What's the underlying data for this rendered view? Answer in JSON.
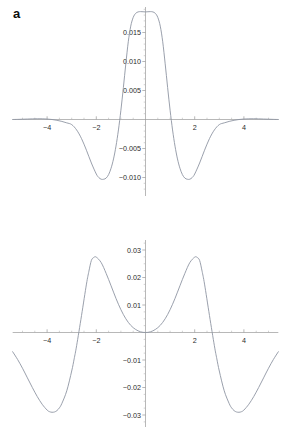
{
  "figure": {
    "panels": [
      {
        "label": "a",
        "chart_data": {
          "type": "line",
          "title": "",
          "xlabel": "",
          "ylabel": "",
          "xlim": [
            -5.4,
            5.4
          ],
          "ylim": [
            -0.0125,
            0.0195
          ],
          "grid": false,
          "legend": null,
          "xticks": [
            -4,
            -2,
            2,
            4
          ],
          "xtick_labels": [
            "-4",
            "-2",
            "2",
            "4"
          ],
          "yticks": [
            0.015,
            0.01,
            0.005,
            -0.005,
            -0.01
          ],
          "ytick_labels": [
            "0.015",
            "0.010",
            "0.005",
            "-0.005",
            "-0.010"
          ],
          "xminor_step": 0.5,
          "yminor_step": 0.001,
          "series": [
            {
              "name": "curve-a",
              "color": "#8f95a3",
              "x": [
                -5.4,
                -5.2,
                -5.0,
                -4.8,
                -4.6,
                -4.4,
                -4.2,
                -4.0,
                -3.8,
                -3.6,
                -3.4,
                -3.2,
                -3.0,
                -2.8,
                -2.6,
                -2.4,
                -2.2,
                -2.0,
                -1.9,
                -1.8,
                -1.7,
                -1.6,
                -1.5,
                -1.4,
                -1.3,
                -1.2,
                -1.1,
                -1.0,
                -0.9,
                -0.8,
                -0.7,
                -0.6,
                -0.5,
                -0.4,
                -0.3,
                -0.2,
                -0.1,
                0.0,
                0.1,
                0.2,
                0.3,
                0.4,
                0.5,
                0.6,
                0.7,
                0.8,
                0.9,
                1.0,
                1.1,
                1.2,
                1.3,
                1.4,
                1.5,
                1.6,
                1.7,
                1.8,
                1.9,
                2.0,
                2.2,
                2.4,
                2.6,
                2.8,
                3.0,
                3.2,
                3.4,
                3.6,
                3.8,
                4.0,
                4.2,
                4.4,
                4.6,
                4.8,
                5.0,
                5.2,
                5.4
              ],
              "y": [
                0.0,
                2e-05,
                5e-05,
                8e-05,
                0.00011,
                0.00013,
                0.00012,
                8e-05,
                0.0,
                -0.00014,
                -0.00033,
                -0.00058,
                -0.00088,
                -0.0018,
                -0.0033,
                -0.0053,
                -0.0075,
                -0.0094,
                -0.01,
                -0.0103,
                -0.0103,
                -0.0101,
                -0.0095,
                -0.0084,
                -0.0068,
                -0.0046,
                -0.0018,
                0.0016,
                0.0055,
                0.0096,
                0.0134,
                0.0161,
                0.0176,
                0.0183,
                0.01855,
                0.0186,
                0.01858,
                0.01855,
                0.01858,
                0.0186,
                0.01855,
                0.0183,
                0.0176,
                0.0161,
                0.0134,
                0.0096,
                0.0055,
                0.0016,
                -0.0018,
                -0.0046,
                -0.0068,
                -0.0084,
                -0.0095,
                -0.0101,
                -0.0103,
                -0.0103,
                -0.01,
                -0.0094,
                -0.0075,
                -0.0053,
                -0.0033,
                -0.0018,
                -0.00088,
                -0.00058,
                -0.00033,
                -0.00014,
                0.0,
                8e-05,
                0.00012,
                0.00013,
                0.00011,
                8e-05,
                5e-05,
                2e-05,
                0.0
              ]
            }
          ]
        }
      },
      {
        "label": "b",
        "chart_data": {
          "type": "line",
          "title": "",
          "xlabel": "",
          "ylabel": "",
          "xlim": [
            -5.4,
            5.4
          ],
          "ylim": [
            -0.034,
            0.034
          ],
          "grid": false,
          "legend": null,
          "xticks": [
            -4,
            -2,
            2,
            4
          ],
          "xtick_labels": [
            "-4",
            "-2",
            "2",
            "4"
          ],
          "yticks": [
            0.03,
            0.02,
            0.01,
            -0.01,
            -0.02,
            -0.03
          ],
          "ytick_labels": [
            "0.03",
            "0.02",
            "0.01",
            "-0.01",
            "-0.02",
            "-0.03"
          ],
          "xminor_step": 0.5,
          "yminor_step": 0.0025,
          "series": [
            {
              "name": "curve-b",
              "color": "#8f95a3",
              "x": [
                -5.4,
                -5.2,
                -5.0,
                -4.8,
                -4.6,
                -4.4,
                -4.2,
                -4.0,
                -3.9,
                -3.8,
                -3.7,
                -3.6,
                -3.5,
                -3.4,
                -3.2,
                -3.0,
                -2.9,
                -2.8,
                -2.6,
                -2.4,
                -2.3,
                -2.2,
                -2.1,
                -2.0,
                -1.8,
                -1.6,
                -1.4,
                -1.2,
                -1.0,
                -0.8,
                -0.6,
                -0.4,
                -0.2,
                0.0,
                0.2,
                0.4,
                0.6,
                0.8,
                1.0,
                1.2,
                1.4,
                1.6,
                1.8,
                2.0,
                2.1,
                2.2,
                2.3,
                2.4,
                2.6,
                2.8,
                2.9,
                3.0,
                3.2,
                3.4,
                3.5,
                3.6,
                3.7,
                3.8,
                3.9,
                4.0,
                4.2,
                4.4,
                4.6,
                4.8,
                5.0,
                5.2,
                5.4
              ],
              "y": [
                -0.007,
                -0.0098,
                -0.013,
                -0.0165,
                -0.02,
                -0.0233,
                -0.0261,
                -0.0282,
                -0.0288,
                -0.029,
                -0.0289,
                -0.0284,
                -0.0274,
                -0.0258,
                -0.0212,
                -0.014,
                -0.0096,
                -0.0048,
                0.0062,
                0.0176,
                0.0223,
                0.0262,
                0.0273,
                0.0274,
                0.0254,
                0.0215,
                0.017,
                0.0124,
                0.0083,
                0.005,
                0.0026,
                0.0011,
                0.00025,
                0.0,
                0.00025,
                0.0011,
                0.0026,
                0.005,
                0.0083,
                0.0124,
                0.017,
                0.0215,
                0.0254,
                0.0274,
                0.0273,
                0.0262,
                0.0223,
                0.0176,
                0.0062,
                -0.0048,
                -0.0096,
                -0.014,
                -0.0212,
                -0.0258,
                -0.0274,
                -0.0284,
                -0.0289,
                -0.029,
                -0.0288,
                -0.0282,
                -0.0261,
                -0.0233,
                -0.02,
                -0.0165,
                -0.013,
                -0.0098,
                -0.007
              ]
            }
          ]
        }
      }
    ]
  }
}
